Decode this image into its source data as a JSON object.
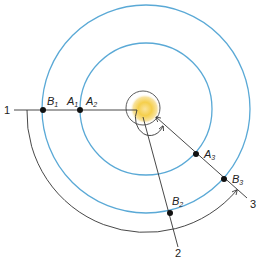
{
  "diagram": {
    "colors": {
      "orbit": "#5aa9d6",
      "line": "#333333",
      "sun_core": "#f5d04a",
      "sun_glow": "#fbe9a8",
      "point": "#111111"
    },
    "center": {
      "label": "Sun"
    },
    "orbits": [
      {
        "name": "inner-orbit",
        "radius": 66
      },
      {
        "name": "outer-orbit",
        "radius": 104
      }
    ],
    "points": [
      {
        "id": "B1",
        "letter": "B",
        "sub": "1"
      },
      {
        "id": "A1",
        "letter": "A",
        "sub": "1"
      },
      {
        "id": "A2",
        "letter": "A",
        "sub": "2"
      },
      {
        "id": "A3",
        "letter": "A",
        "sub": "3"
      },
      {
        "id": "B2",
        "letter": "B",
        "sub": "2"
      },
      {
        "id": "B3",
        "letter": "B",
        "sub": "3"
      }
    ],
    "lines": [
      {
        "id": "1",
        "label": "1"
      },
      {
        "id": "2",
        "label": "2"
      },
      {
        "id": "3",
        "label": "3"
      }
    ]
  }
}
